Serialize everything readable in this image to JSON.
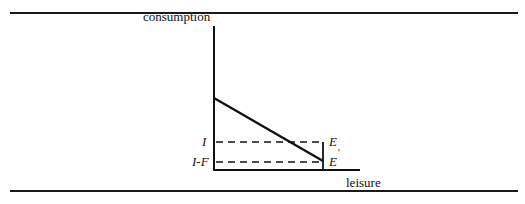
{
  "figure": {
    "axis_labels": {
      "y": "consumption",
      "x": "leisure"
    },
    "tick_labels": {
      "income": "I",
      "income_minus_fee": "I-F"
    },
    "points": {
      "E": "E",
      "E_prime": "E",
      "E_prime_mark": "'"
    },
    "elements": [
      "budget line",
      "dashed line at I",
      "dashed line at I-F",
      "vertical segment E to E'"
    ]
  }
}
